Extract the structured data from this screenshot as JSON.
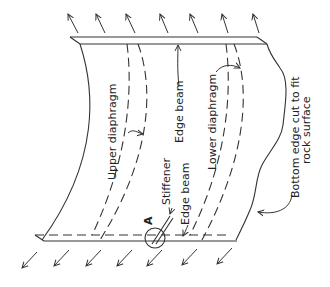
{
  "figure": {
    "labels": {
      "upper_diaphragm": "Upper diaphragm",
      "edge_beam_top": "Edge beam",
      "lower_diaphragm": "Lower diaphragm",
      "stiffener": "Stiffener",
      "edge_beam_bottom": "Edge beam",
      "detail_marker": "A",
      "bottom_edge_line1": "Bottom edge cut to fit",
      "bottom_edge_line2": "rock surface"
    },
    "load_arrows": {
      "top_count": 6,
      "bottom_count": 7
    },
    "colors": {
      "line": "#333333",
      "background": "#ffffff"
    }
  }
}
